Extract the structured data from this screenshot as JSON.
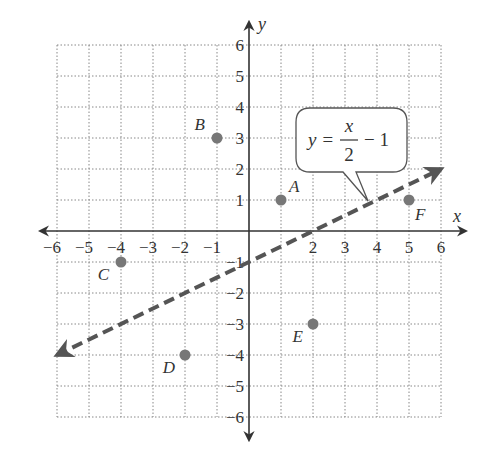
{
  "chart_data": {
    "type": "scatter",
    "title": "",
    "xlabel": "x",
    "ylabel": "y",
    "xlim": [
      -6,
      6
    ],
    "ylim": [
      -6,
      6
    ],
    "grid": true,
    "x_ticks": [
      -6,
      -5,
      -4,
      -3,
      -2,
      -1,
      2,
      3,
      4,
      5,
      6
    ],
    "y_ticks": [
      6,
      5,
      4,
      3,
      2,
      1,
      -1,
      -2,
      -3,
      -4,
      -5,
      -6
    ],
    "points": [
      {
        "label": "A",
        "x": 1,
        "y": 1
      },
      {
        "label": "B",
        "x": -1,
        "y": 3
      },
      {
        "label": "C",
        "x": -4,
        "y": -1
      },
      {
        "label": "D",
        "x": -2,
        "y": -4
      },
      {
        "label": "E",
        "x": 2,
        "y": -3
      },
      {
        "label": "F",
        "x": 5,
        "y": 1
      }
    ],
    "line": {
      "equation": "y = x/2 - 1",
      "style": "dashed",
      "from": [
        -6,
        -4
      ],
      "to": [
        6,
        2
      ],
      "arrows": "both"
    },
    "annotations": [
      {
        "type": "callout",
        "text": "y = x/2 − 1",
        "points_to": [
          3.8,
          0.9
        ]
      }
    ]
  },
  "labels": {
    "x_axis": "x",
    "y_axis": "y",
    "equation_lhs": "y =",
    "equation_num": "x",
    "equation_den": "2",
    "equation_rhs": "− 1"
  },
  "colors": {
    "point": "#777777",
    "line": "#555555",
    "grid": "#888888",
    "axis": "#333333",
    "text": "#333333"
  }
}
